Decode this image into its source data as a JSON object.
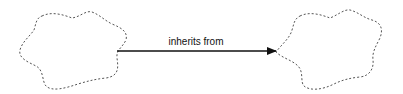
{
  "diagram": {
    "edge": {
      "label": "inherits from",
      "color": "#111111"
    },
    "nodes": [
      {
        "id": "left-cloud",
        "label": "",
        "border_color": "#555555",
        "border_style": "dashed"
      },
      {
        "id": "right-cloud",
        "label": "",
        "border_color": "#555555",
        "border_style": "dashed"
      }
    ]
  }
}
